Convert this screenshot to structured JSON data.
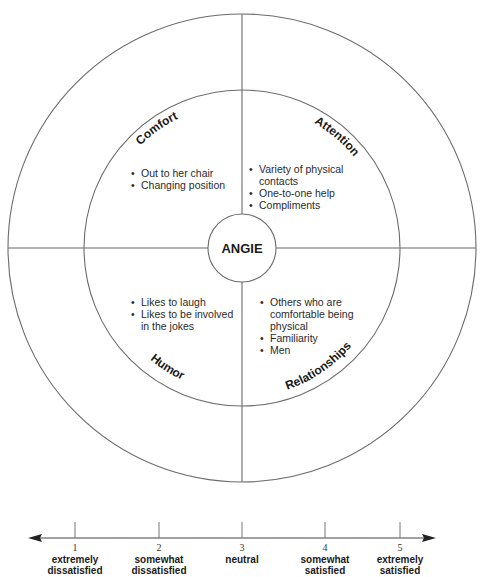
{
  "center": {
    "name": "ANGIE"
  },
  "quadrants": [
    {
      "id": "comfort",
      "title": "Comfort",
      "items": [
        "Out to her chair",
        "Changing position"
      ]
    },
    {
      "id": "attention",
      "title": "Attention",
      "items": [
        "Variety of physical contacts",
        "One-to-one help",
        "Compliments"
      ]
    },
    {
      "id": "humor",
      "title": "Humor",
      "items": [
        "Likes to laugh",
        "Likes to be involved in the jokes"
      ]
    },
    {
      "id": "relationships",
      "title": "Relationships",
      "items": [
        "Others who are comfortable being physical",
        "Familiarity",
        "Men"
      ]
    }
  ],
  "scale": {
    "points": [
      {
        "value": "1",
        "label_line1": "extremely",
        "label_line2": "dissatisfied"
      },
      {
        "value": "2",
        "label_line1": "somewhat",
        "label_line2": "dissatisfied"
      },
      {
        "value": "3",
        "label_line1": "neutral",
        "label_line2": ""
      },
      {
        "value": "4",
        "label_line1": "somewhat",
        "label_line2": "satisfied"
      },
      {
        "value": "5",
        "label_line1": "extremely",
        "label_line2": "satisfied"
      }
    ]
  }
}
